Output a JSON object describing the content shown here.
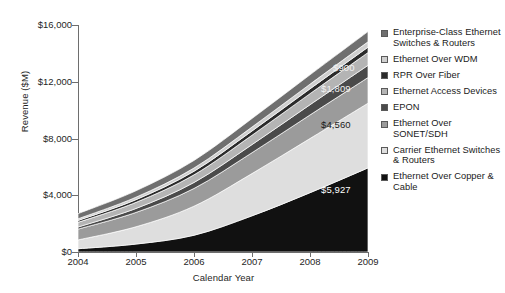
{
  "chart_data": {
    "type": "area",
    "title": "",
    "xlabel": "Calendar Year",
    "ylabel": "Revenue ($M)",
    "categories": [
      "2004",
      "2005",
      "2006",
      "2007",
      "2008",
      "2009"
    ],
    "x": [
      2004,
      2005,
      2006,
      2007,
      2008,
      2009
    ],
    "ylim": [
      0,
      16000
    ],
    "yticks": [
      "$0",
      "$4,000",
      "$8,000",
      "$12,000",
      "$16,000"
    ],
    "ytick_values": [
      0,
      4000,
      8000,
      12000,
      16000
    ],
    "grid": false,
    "stacked": true,
    "legend_position": "right",
    "series": [
      {
        "name": "Ethernet Over Copper & Cable",
        "color": "#111111",
        "values": [
          230,
          560,
          1180,
          2550,
          4180,
          5927
        ],
        "data_label": "$5,927"
      },
      {
        "name": "Carrier Ethernet Switches & Routers",
        "color": "#dedede",
        "values": [
          620,
          1220,
          2050,
          2980,
          3820,
          4560
        ],
        "data_label": "$4,560"
      },
      {
        "name": "Ethernet Over SONET/SDH",
        "color": "#9b9b9b",
        "values": [
          760,
          1010,
          1250,
          1470,
          1660,
          1809
        ],
        "data_label": "$1,809"
      },
      {
        "name": "EPON",
        "color": "#4a4a4a",
        "values": [
          150,
          280,
          420,
          570,
          720,
          860
        ],
        "data_label": ""
      },
      {
        "name": "Ethernet Access Devices",
        "color": "#b4b4b4",
        "values": [
          330,
          430,
          540,
          660,
          780,
          900
        ],
        "data_label": "$900"
      },
      {
        "name": "RPR Over Fiber",
        "color": "#2b2b2b",
        "values": [
          130,
          190,
          250,
          300,
          340,
          380
        ],
        "data_label": ""
      },
      {
        "name": "Ethernet Over WDM",
        "color": "#cfcfcf",
        "values": [
          120,
          175,
          230,
          280,
          330,
          380
        ],
        "data_label": ""
      },
      {
        "name": "Enterprise-Class Ethernet Switches & Routers",
        "color": "#6f6f6f",
        "values": [
          360,
          450,
          530,
          600,
          660,
          720
        ],
        "data_label": ""
      }
    ],
    "data_labels": [
      {
        "text": "$5,927",
        "color": "#ffffff",
        "x": 321,
        "y": 184
      },
      {
        "text": "$4,560",
        "color": "#1a1a1a",
        "x": 321,
        "y": 119
      },
      {
        "text": "$1,809",
        "color": "#f2f2f2",
        "x": 321,
        "y": 83
      },
      {
        "text": "$900",
        "color": "#f2f2f2",
        "x": 333,
        "y": 62
      }
    ]
  },
  "legend": {
    "items": [
      {
        "label": "Enterprise-Class Ethernet Switches & Routers",
        "color": "#6f6f6f"
      },
      {
        "label": "Ethernet Over WDM",
        "color": "#cfcfcf"
      },
      {
        "label": "RPR Over Fiber",
        "color": "#2b2b2b"
      },
      {
        "label": "Ethernet Access Devices",
        "color": "#b4b4b4"
      },
      {
        "label": "EPON",
        "color": "#4a4a4a"
      },
      {
        "label": "Ethernet Over SONET/SDH",
        "color": "#9b9b9b"
      },
      {
        "label": "Carrier Ethernet Switches & Routers",
        "color": "#dedede"
      },
      {
        "label": "Ethernet Over Copper & Cable",
        "color": "#111111"
      }
    ]
  }
}
